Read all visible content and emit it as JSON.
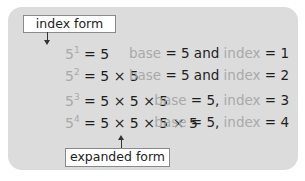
{
  "labels": {
    "index_form": "index form",
    "expanded_form": "expanded form"
  },
  "rows": [
    {
      "base": "5",
      "exponent": "1",
      "expansion": "= 5",
      "rhs_base_word": "base",
      "rhs_rest": "= 5 and ",
      "rhs_index_word": "index",
      "rhs_value": " = 1"
    },
    {
      "base": "5",
      "exponent": "2",
      "expansion": "= 5 × 5",
      "rhs_base_word": "base",
      "rhs_rest": "= 5 and ",
      "rhs_index_word": "index",
      "rhs_value": " = 2"
    },
    {
      "base": "5",
      "exponent": "3",
      "expansion": "= 5 × 5 × 5",
      "rhs_base_word": "base",
      "rhs_rest": "= 5, ",
      "rhs_index_word": "index",
      "rhs_value": " = 3"
    },
    {
      "base": "5",
      "exponent": "4",
      "expansion": "= 5 × 5 × 5 × 5",
      "rhs_base_word": "base",
      "rhs_rest": "= 5, ",
      "rhs_index_word": "index",
      "rhs_value": " = 4"
    }
  ],
  "colors": {
    "panel": "#dcdcdc",
    "muted_text": "#a9a9a9",
    "main_text": "#1e1e1e"
  }
}
